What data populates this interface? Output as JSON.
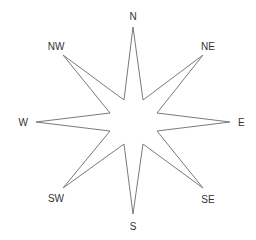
{
  "diagram": {
    "type": "compass-rose",
    "points": 8,
    "stroke_color": "#7a7a7a",
    "fill_color": "#ffffff",
    "label_color": "#333333",
    "center": [
      133,
      122
    ],
    "star_polygon": [
      [
        133,
        27
      ],
      [
        143,
        100
      ],
      [
        203,
        55
      ],
      [
        157,
        113
      ],
      [
        230,
        122
      ],
      [
        157,
        131
      ],
      [
        203,
        188
      ],
      [
        143,
        144
      ],
      [
        133,
        214
      ],
      [
        124,
        144
      ],
      [
        63,
        188
      ],
      [
        110,
        131
      ],
      [
        36,
        122
      ],
      [
        110,
        113
      ],
      [
        63,
        55
      ],
      [
        124,
        100
      ]
    ],
    "labels": [
      {
        "id": "N",
        "text": "N",
        "x": 133,
        "y": 20,
        "anchor": "middle"
      },
      {
        "id": "NE",
        "text": "NE",
        "x": 208,
        "y": 50,
        "anchor": "middle"
      },
      {
        "id": "E",
        "text": "E",
        "x": 238,
        "y": 126,
        "anchor": "start"
      },
      {
        "id": "SE",
        "text": "SE",
        "x": 208,
        "y": 203,
        "anchor": "middle"
      },
      {
        "id": "S",
        "text": "S",
        "x": 133,
        "y": 230,
        "anchor": "middle"
      },
      {
        "id": "SW",
        "text": "SW",
        "x": 56,
        "y": 202,
        "anchor": "middle"
      },
      {
        "id": "W",
        "text": "W",
        "x": 28,
        "y": 126,
        "anchor": "end"
      },
      {
        "id": "NW",
        "text": "NW",
        "x": 56,
        "y": 50,
        "anchor": "middle"
      }
    ]
  }
}
